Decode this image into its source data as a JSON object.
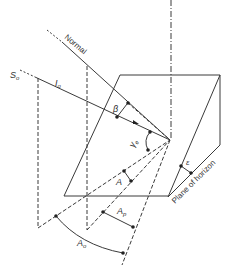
{
  "figure": {
    "colors": {
      "line": "#3a3a3a",
      "background": "#ffffff"
    },
    "labels": {
      "normal": "Normal",
      "sun_direction": "S",
      "sun_direction_sub": "o",
      "irradiance": "I",
      "irradiance_sub": "o",
      "beta": "β",
      "zenith_angle": "γ",
      "zenith_angle_sub": "e",
      "azimuth_diff": "A",
      "surface_azimuth": "A",
      "surface_azimuth_sub": "p",
      "solar_azimuth": "A",
      "solar_azimuth_sub": "o",
      "tilt": "ε",
      "plane_of_horizon": "Plane of horizon"
    }
  }
}
